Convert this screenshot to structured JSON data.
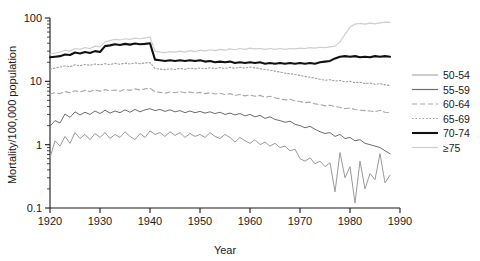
{
  "chart_data": {
    "type": "line",
    "title": "",
    "xlabel": "Year",
    "ylabel": "Mortality/100,000 population",
    "xlim": [
      1920,
      1990
    ],
    "ylim": [
      0.1,
      100
    ],
    "yscale": "log",
    "grid": false,
    "legend_position": "right",
    "xticks": [
      "1920",
      "1930",
      "1940",
      "1950",
      "1960",
      "1970",
      "1980",
      "1990"
    ],
    "yticks": [
      "0.1",
      "1",
      "10",
      "100"
    ],
    "x": [
      1920,
      1921,
      1922,
      1923,
      1924,
      1925,
      1926,
      1927,
      1928,
      1929,
      1930,
      1931,
      1932,
      1933,
      1934,
      1935,
      1936,
      1937,
      1938,
      1939,
      1940,
      1941,
      1942,
      1943,
      1944,
      1945,
      1946,
      1947,
      1948,
      1949,
      1950,
      1951,
      1952,
      1953,
      1954,
      1955,
      1956,
      1957,
      1958,
      1959,
      1960,
      1961,
      1962,
      1963,
      1964,
      1965,
      1966,
      1967,
      1968,
      1969,
      1970,
      1971,
      1972,
      1973,
      1974,
      1975,
      1976,
      1977,
      1978,
      1979,
      1980,
      1981,
      1982,
      1983,
      1984,
      1985,
      1986,
      1987,
      1988
    ],
    "series": [
      {
        "name": "50-54",
        "color": "#9a9a9a",
        "width": 1.0,
        "dash": "none",
        "values": [
          0.62,
          1.15,
          0.95,
          1.35,
          1.05,
          1.55,
          1.25,
          1.45,
          1.2,
          1.5,
          1.3,
          1.55,
          1.25,
          1.45,
          1.3,
          1.6,
          1.35,
          1.2,
          1.5,
          1.3,
          1.65,
          1.45,
          1.55,
          1.35,
          1.6,
          1.4,
          1.55,
          1.3,
          1.5,
          1.35,
          1.45,
          1.3,
          1.55,
          1.35,
          1.25,
          1.45,
          1.3,
          1.1,
          1.3,
          1.15,
          1.05,
          1.2,
          1.0,
          1.1,
          0.95,
          1.05,
          0.9,
          0.95,
          0.8,
          0.85,
          0.6,
          0.55,
          0.62,
          0.5,
          0.55,
          0.45,
          0.52,
          0.18,
          0.75,
          0.3,
          0.45,
          0.12,
          0.55,
          0.2,
          0.35,
          0.28,
          0.72,
          0.25,
          0.33
        ]
      },
      {
        "name": "55-59",
        "color": "#6e6e6e",
        "width": 1.0,
        "dash": "none",
        "values": [
          1.95,
          2.4,
          2.2,
          3.05,
          2.7,
          3.3,
          2.95,
          3.25,
          3.0,
          3.4,
          3.1,
          3.5,
          3.15,
          3.4,
          3.2,
          3.55,
          3.25,
          3.6,
          3.3,
          3.55,
          3.7,
          3.45,
          3.6,
          3.35,
          3.55,
          3.3,
          3.45,
          3.2,
          3.4,
          3.2,
          3.35,
          3.15,
          3.3,
          3.1,
          3.25,
          3.0,
          3.15,
          2.95,
          3.1,
          2.85,
          3.0,
          2.75,
          2.9,
          2.6,
          2.75,
          2.5,
          2.4,
          2.25,
          2.35,
          2.1,
          2.0,
          1.85,
          1.95,
          1.75,
          1.6,
          1.5,
          1.55,
          1.35,
          1.45,
          1.25,
          1.3,
          1.15,
          1.2,
          1.05,
          1.0,
          0.95,
          0.9,
          0.8,
          0.72
        ]
      },
      {
        "name": "60-64",
        "color": "#a8a8a8",
        "width": 1.1,
        "dash": "5,3",
        "values": [
          6.3,
          6.6,
          6.4,
          6.9,
          6.6,
          7.1,
          6.8,
          7.2,
          6.9,
          7.3,
          7.0,
          7.4,
          7.1,
          7.3,
          7.0,
          7.5,
          7.2,
          7.6,
          7.3,
          7.6,
          7.8,
          6.9,
          6.7,
          6.5,
          6.8,
          6.6,
          6.9,
          6.6,
          6.8,
          6.5,
          6.7,
          6.4,
          6.6,
          6.3,
          6.5,
          6.2,
          6.4,
          6.0,
          6.2,
          5.9,
          6.1,
          5.8,
          6.0,
          5.6,
          5.8,
          5.5,
          5.3,
          5.1,
          5.2,
          4.9,
          4.8,
          4.6,
          4.7,
          4.4,
          4.3,
          4.1,
          4.2,
          4.0,
          3.9,
          3.7,
          3.8,
          3.6,
          3.5,
          3.45,
          3.4,
          3.3,
          3.5,
          3.25,
          3.2
        ]
      },
      {
        "name": "65-69",
        "color": "#9e9e9e",
        "width": 1.1,
        "dash": "1.5,2",
        "values": [
          15.5,
          16.2,
          16.8,
          17.5,
          17.0,
          18.2,
          17.6,
          18.5,
          17.9,
          18.8,
          18.2,
          19.0,
          18.4,
          19.2,
          18.6,
          19.4,
          18.8,
          19.6,
          19.0,
          19.5,
          19.8,
          16.0,
          15.6,
          15.2,
          15.8,
          15.4,
          16.0,
          15.5,
          16.2,
          15.7,
          16.3,
          15.8,
          16.4,
          15.9,
          16.5,
          16.0,
          16.6,
          16.1,
          16.7,
          16.2,
          16.8,
          16.3,
          15.9,
          15.4,
          15.0,
          14.5,
          14.0,
          13.5,
          13.2,
          12.8,
          12.4,
          12.0,
          11.6,
          11.2,
          10.8,
          10.4,
          10.6,
          10.1,
          10.3,
          9.8,
          10.0,
          9.5,
          9.7,
          9.2,
          9.4,
          9.0,
          9.2,
          8.8,
          8.6
        ]
      },
      {
        "name": "70-74",
        "color": "#111111",
        "width": 2.1,
        "dash": "none",
        "values": [
          24.0,
          24.5,
          25.0,
          26.5,
          26.0,
          28.5,
          27.5,
          29.0,
          28.0,
          30.0,
          29.0,
          36.0,
          37.0,
          38.5,
          37.5,
          39.0,
          38.0,
          39.5,
          38.5,
          39.0,
          40.0,
          22.0,
          21.5,
          21.0,
          21.5,
          21.0,
          21.5,
          21.0,
          21.5,
          21.0,
          21.5,
          20.5,
          21.0,
          20.0,
          20.5,
          20.0,
          20.5,
          19.5,
          20.0,
          19.5,
          20.0,
          19.5,
          20.0,
          19.0,
          19.5,
          19.0,
          19.5,
          19.0,
          19.5,
          19.0,
          19.5,
          19.0,
          19.5,
          19.0,
          20.0,
          20.5,
          21.0,
          23.0,
          24.5,
          25.0,
          24.5,
          25.0,
          24.0,
          24.5,
          24.0,
          25.0,
          24.5,
          25.0,
          24.5
        ]
      },
      {
        "name": "≥75",
        "color": "#cfcfcf",
        "width": 1.2,
        "dash": "none",
        "values": [
          27.0,
          28.0,
          29.0,
          31.0,
          30.0,
          33.0,
          32.0,
          34.0,
          33.0,
          36.0,
          35.0,
          42.0,
          44.0,
          46.0,
          45.0,
          47.0,
          46.0,
          48.0,
          47.0,
          48.5,
          50.0,
          30.0,
          29.0,
          28.5,
          29.5,
          29.0,
          30.0,
          29.0,
          30.5,
          29.5,
          31.0,
          30.0,
          31.5,
          30.5,
          32.0,
          31.0,
          32.5,
          31.5,
          33.0,
          32.0,
          33.5,
          32.5,
          33.0,
          32.0,
          33.0,
          32.0,
          33.0,
          32.0,
          33.0,
          32.5,
          33.5,
          33.0,
          34.0,
          33.5,
          34.5,
          34.0,
          35.0,
          36.0,
          42.0,
          55.0,
          72.0,
          80.0,
          82.0,
          80.0,
          83.0,
          81.0,
          84.0,
          86.0,
          85.0
        ]
      }
    ],
    "legend": [
      {
        "label": "50-54",
        "color": "#9a9a9a",
        "width": 1.0,
        "dash": "none"
      },
      {
        "label": "55-59",
        "color": "#6e6e6e",
        "width": 1.2,
        "dash": "none"
      },
      {
        "label": "60-64",
        "color": "#a8a8a8",
        "width": 1.1,
        "dash": "5,3"
      },
      {
        "label": "65-69",
        "color": "#9e9e9e",
        "width": 1.1,
        "dash": "1.5,2"
      },
      {
        "label": "70-74",
        "color": "#111111",
        "width": 2.1,
        "dash": "none"
      },
      {
        "label": "≥75",
        "color": "#cfcfcf",
        "width": 1.2,
        "dash": "none"
      }
    ]
  }
}
